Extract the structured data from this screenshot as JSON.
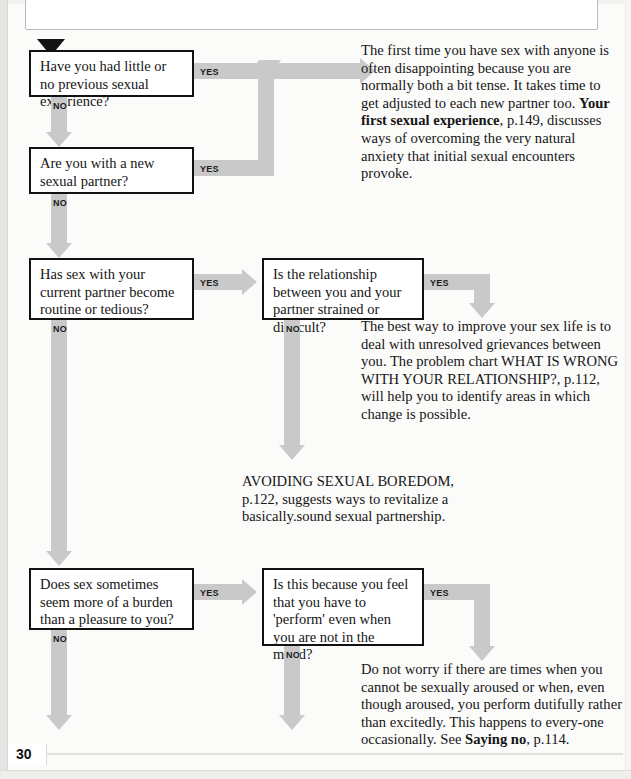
{
  "page": {
    "title": "SEX COUNSELLING",
    "number": "30"
  },
  "boxes": [
    {
      "id": "q1",
      "text": "Have you had little or no previous sexual experience?",
      "yes_label": "YES",
      "no_label": "NO"
    },
    {
      "id": "q2",
      "text": "Are you with a new sexual partner?",
      "yes_label": "YES",
      "no_label": "NO"
    },
    {
      "id": "q3",
      "text": "Has sex with your current partner become routine or tedious?",
      "yes_label": "YES",
      "no_label": "NO"
    },
    {
      "id": "q4",
      "text": "Is the relationship between you and your partner strained or difficult?",
      "yes_label": "YES",
      "no_label": "NO"
    },
    {
      "id": "q5",
      "text": "Does sex sometimes seem more of a burden than a pleasure to you?",
      "yes_label": "YES",
      "no_label": "NO"
    },
    {
      "id": "q6",
      "text": "Is this because you feel that you have to 'perform' even when you are not in the mood?",
      "yes_label": "YES",
      "no_label": "NO"
    }
  ],
  "advice": {
    "first_experience": {
      "part1": "The first time you have sex with anyone is often disappointing because you are normally both a bit tense. It takes time to get adjusted to each new partner too. ",
      "emphasis": "Your first sexual experience",
      "part2": ", p.149, discusses ways of overcoming the very natural anxiety that initial sexual encounters provoke."
    },
    "relationship": {
      "part1": "The best way to improve your sex life is to deal with unresolved grievances between you. The problem chart WHAT IS WRONG WITH YOUR RELATIONSHIP?, p.112, will help you to identify areas in which change is possible."
    },
    "boredom": {
      "part1": "AVOIDING SEXUAL BOREDOM, p.122, suggests ways to revitalize a basically.sound sexual partnership."
    },
    "performance": {
      "part1": "Do not worry if there are times when you cannot be sexually aroused or when, even though aroused, you perform dutifully rather than excitedly. This happens to every-one occasionally. See ",
      "emphasis": "Saying no",
      "part2": ", p.114."
    }
  },
  "colors": {
    "arrow": "#c9c9c9",
    "box_border": "#111111",
    "ink": "#161616"
  }
}
